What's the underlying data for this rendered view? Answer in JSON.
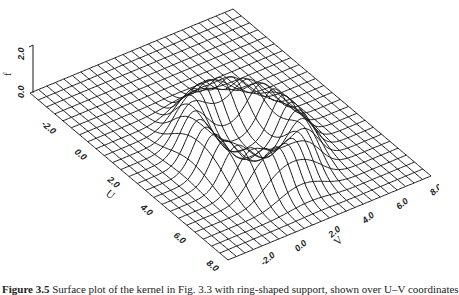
{
  "chart_data": {
    "type": "surface",
    "title": "",
    "xlabel": "U",
    "ylabel": "V",
    "zlabel": "f",
    "u_ticks": [
      "-2.0",
      "0.0",
      "2.0",
      "4.0",
      "6.0",
      "8.0"
    ],
    "v_ticks": [
      "-2.0",
      "0.0",
      "2.0",
      "4.0",
      "6.0",
      "8.0"
    ],
    "z_ticks": [
      "0.0",
      "2.0"
    ],
    "u_range": [
      -4,
      8
    ],
    "v_range": [
      -4,
      8
    ],
    "z_range": [
      0,
      2
    ],
    "grid_lines": 25,
    "surface": {
      "shape": "ring",
      "center_u": 3.2,
      "center_v": 1.8,
      "ring_radius": 2.3,
      "ring_width": 1.0,
      "peak_height": 1.6
    },
    "grid": true,
    "legend": null
  },
  "caption": {
    "label": "Figure 3.5",
    "text": "Surface plot of the kernel in Fig. 3.3 with ring-shaped support, shown over U–V coordinates"
  },
  "colors": {
    "line": "#1a1a1a",
    "background": "#ffffff"
  }
}
